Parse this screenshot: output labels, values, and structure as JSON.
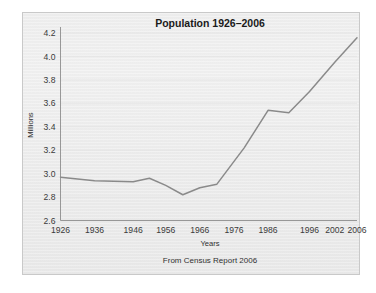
{
  "figure": {
    "background_color": "#ffffff",
    "panel_color": "#eeeeee",
    "border_color": "#c9c9c9"
  },
  "chart_data": {
    "type": "line",
    "title": "Population 1926–2006",
    "xlabel": "Years",
    "ylabel": "Millions",
    "caption": "From Census Report 2006",
    "xlim": [
      1926,
      2006
    ],
    "ylim": [
      2.6,
      4.2
    ],
    "xticks": [
      1926,
      1936,
      1946,
      1956,
      1966,
      1976,
      1986,
      1996,
      2002,
      2006
    ],
    "xtick_labels": [
      "1926",
      "1936",
      "1946",
      "1956",
      "1966",
      "1976",
      "1986",
      "1996",
      "2002",
      "2006"
    ],
    "yticks": [
      2.6,
      2.8,
      3.0,
      3.2,
      3.4,
      3.6,
      3.8,
      4.0,
      4.2
    ],
    "ytick_labels": [
      "2.6",
      "2.8",
      "3.0",
      "3.2",
      "3.4",
      "3.6",
      "3.8",
      "4.0",
      "4.2"
    ],
    "grid": true,
    "legend": null,
    "line_color": "#8a8a8a",
    "series": [
      {
        "name": "Population",
        "x": [
          1926,
          1936,
          1946,
          1951,
          1956,
          1961,
          1966,
          1971,
          1979,
          1986,
          1991,
          1996,
          2002,
          2006
        ],
        "values": [
          2.97,
          2.94,
          2.93,
          2.96,
          2.9,
          2.82,
          2.88,
          2.91,
          3.22,
          3.54,
          3.52,
          3.7,
          3.95,
          4.16
        ]
      }
    ]
  }
}
